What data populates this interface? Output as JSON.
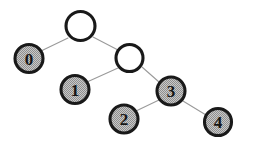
{
  "diagram": {
    "type": "binary-tree",
    "canvas": {
      "width": 256,
      "height": 150,
      "background": "#ffffff"
    },
    "style": {
      "node_fill_gray": "#b0b0b0",
      "node_fill_white": "#ffffff",
      "node_stroke": "#191919",
      "edge_color": "#9a9a9a",
      "label_color": "#151515",
      "node_radius": 14,
      "node_stroke_width": 3.1,
      "edge_stroke_width": 1.1
    },
    "nodes": [
      {
        "id": "root",
        "label": "",
        "cx": 80.5,
        "cy": 26,
        "r": 14.5,
        "fill": "white",
        "filled": false
      },
      {
        "id": "n0",
        "label": "0",
        "cx": 29,
        "cy": 58.5,
        "r": 14,
        "fill": "gray",
        "filled": true
      },
      {
        "id": "inner",
        "label": "",
        "cx": 129.5,
        "cy": 58,
        "r": 13.5,
        "fill": "white",
        "filled": false
      },
      {
        "id": "n1",
        "label": "1",
        "cx": 75,
        "cy": 89.5,
        "r": 14,
        "fill": "gray",
        "filled": true
      },
      {
        "id": "n3",
        "label": "3",
        "cx": 171,
        "cy": 91,
        "r": 14,
        "fill": "gray",
        "filled": true
      },
      {
        "id": "n2",
        "label": "2",
        "cx": 124,
        "cy": 119,
        "r": 14,
        "fill": "gray",
        "filled": true
      },
      {
        "id": "n4",
        "label": "4",
        "cx": 218,
        "cy": 122,
        "r": 13.5,
        "fill": "gray",
        "filled": true
      }
    ],
    "edges": [
      {
        "id": "edge-root-n0",
        "from": "root",
        "to": "n0",
        "x1": 68,
        "y1": 38,
        "x2": 41,
        "y2": 51
      },
      {
        "id": "edge-root-inner",
        "from": "root",
        "to": "inner",
        "x1": 93,
        "y1": 37,
        "x2": 118,
        "y2": 50
      },
      {
        "id": "edge-inner-n1",
        "from": "inner",
        "to": "n1",
        "x1": 118,
        "y1": 68,
        "x2": 87,
        "y2": 82
      },
      {
        "id": "edge-inner-n3",
        "from": "inner",
        "to": "n3",
        "x1": 142,
        "y1": 67,
        "x2": 159,
        "y2": 82
      },
      {
        "id": "edge-n3-n2",
        "from": "n3",
        "to": "n2",
        "x1": 159,
        "y1": 100,
        "x2": 136,
        "y2": 111
      },
      {
        "id": "edge-n3-n4",
        "from": "n3",
        "to": "n4",
        "x1": 183,
        "y1": 101,
        "x2": 206,
        "y2": 115
      }
    ]
  }
}
